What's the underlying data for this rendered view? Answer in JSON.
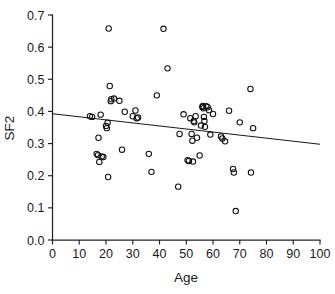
{
  "chart_data": {
    "type": "scatter",
    "title": "",
    "xlabel": "Age",
    "ylabel": "SF2",
    "xlim": [
      0,
      100
    ],
    "ylim": [
      0.0,
      0.7
    ],
    "grid": false,
    "legend": null,
    "xticks": [
      0,
      10,
      20,
      30,
      40,
      50,
      60,
      70,
      80,
      90,
      100
    ],
    "xtick_labels": [
      "0",
      "10",
      "20",
      "30",
      "40",
      "50",
      "60",
      "70",
      "80",
      "90",
      "100"
    ],
    "yticks": [
      0.0,
      0.1,
      0.2,
      0.3,
      0.4,
      0.5,
      0.6,
      0.7
    ],
    "ytick_labels": [
      "0.0",
      "0.1",
      "0.2",
      "0.3",
      "0.4",
      "0.5",
      "0.6",
      "0.7"
    ],
    "marker": "open-circle",
    "marker_color": "#111111",
    "points": [
      [
        14.0,
        0.385
      ],
      [
        14.8,
        0.383
      ],
      [
        16.5,
        0.268
      ],
      [
        17.0,
        0.264
      ],
      [
        17.2,
        0.318
      ],
      [
        17.5,
        0.243
      ],
      [
        18.0,
        0.39
      ],
      [
        18.4,
        0.26
      ],
      [
        19.0,
        0.258
      ],
      [
        20.0,
        0.355
      ],
      [
        20.3,
        0.348
      ],
      [
        20.6,
        0.365
      ],
      [
        20.8,
        0.196
      ],
      [
        21.0,
        0.658
      ],
      [
        21.4,
        0.479
      ],
      [
        21.8,
        0.432
      ],
      [
        22.0,
        0.438
      ],
      [
        23.0,
        0.44
      ],
      [
        25.0,
        0.433
      ],
      [
        26.0,
        0.281
      ],
      [
        27.0,
        0.399
      ],
      [
        30.0,
        0.385
      ],
      [
        31.0,
        0.403
      ],
      [
        31.5,
        0.379
      ],
      [
        32.0,
        0.381
      ],
      [
        36.0,
        0.268
      ],
      [
        37.0,
        0.212
      ],
      [
        39.0,
        0.45
      ],
      [
        41.5,
        0.657
      ],
      [
        43.0,
        0.534
      ],
      [
        47.0,
        0.166
      ],
      [
        47.5,
        0.33
      ],
      [
        49.0,
        0.391
      ],
      [
        50.5,
        0.248
      ],
      [
        51.0,
        0.246
      ],
      [
        51.5,
        0.379
      ],
      [
        52.0,
        0.33
      ],
      [
        52.3,
        0.309
      ],
      [
        52.5,
        0.244
      ],
      [
        52.8,
        0.37
      ],
      [
        53.0,
        0.366
      ],
      [
        53.5,
        0.385
      ],
      [
        54.0,
        0.318
      ],
      [
        55.0,
        0.263
      ],
      [
        55.5,
        0.356
      ],
      [
        56.0,
        0.414
      ],
      [
        56.2,
        0.417
      ],
      [
        56.4,
        0.41
      ],
      [
        56.6,
        0.383
      ],
      [
        56.8,
        0.37
      ],
      [
        57.0,
        0.352
      ],
      [
        57.5,
        0.416
      ],
      [
        58.0,
        0.413
      ],
      [
        58.5,
        0.404
      ],
      [
        59.0,
        0.328
      ],
      [
        60.0,
        0.392
      ],
      [
        63.0,
        0.322
      ],
      [
        63.5,
        0.316
      ],
      [
        64.5,
        0.307
      ],
      [
        66.0,
        0.402
      ],
      [
        67.5,
        0.221
      ],
      [
        67.8,
        0.21
      ],
      [
        68.5,
        0.09
      ],
      [
        70.0,
        0.366
      ],
      [
        74.0,
        0.47
      ],
      [
        74.2,
        0.21
      ],
      [
        75.0,
        0.348
      ]
    ],
    "fit_line": {
      "type": "linear-regression",
      "x": [
        0,
        100
      ],
      "y": [
        0.393,
        0.298
      ]
    }
  }
}
